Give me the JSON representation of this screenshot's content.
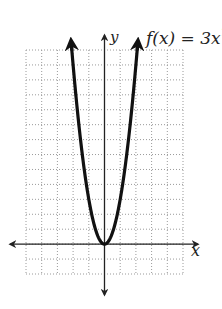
{
  "chart_data": {
    "type": "line",
    "title": "",
    "function_label": "f(x) = 3x",
    "function_label_exponent": "2",
    "xlabel": "x",
    "ylabel": "y",
    "xlim": [
      -5,
      5
    ],
    "ylim": [
      -2,
      13
    ],
    "grid": true,
    "grid_style": "dotted",
    "grid_step": 1,
    "series": [
      {
        "name": "f(x) = 3x^2",
        "x": [
          -2.1,
          -2,
          -1.5,
          -1,
          -0.5,
          0,
          0.5,
          1,
          1.5,
          2,
          2.1
        ],
        "y": [
          13.23,
          12,
          6.75,
          3,
          0.75,
          0,
          0.75,
          3,
          6.75,
          12,
          13.23
        ]
      }
    ],
    "axis_arrows": true,
    "curve_arrows": true,
    "colors": {
      "curve": "#111111",
      "axis": "#222222",
      "grid": "#9a9a9a"
    }
  }
}
